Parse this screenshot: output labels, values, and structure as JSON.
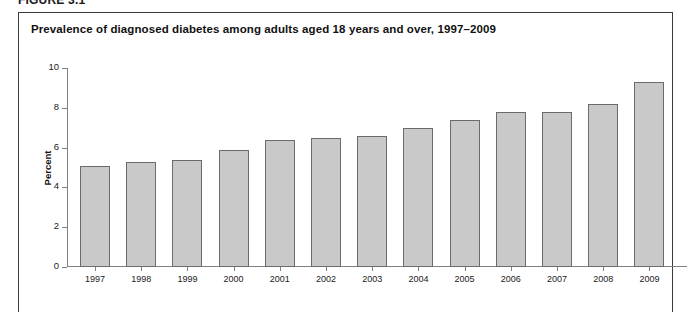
{
  "figure": {
    "label": "FIGURE 3.1",
    "title": "Prevalence of diagnosed diabetes among adults aged 18 years and over, 1997–2009"
  },
  "chart_data": {
    "type": "bar",
    "title": "Prevalence of diagnosed diabetes among adults aged 18 years and over, 1997–2009",
    "xlabel": "",
    "ylabel": "Percent",
    "ylim": [
      0,
      10
    ],
    "yticks": [
      0,
      2,
      4,
      6,
      8,
      10
    ],
    "ytick_labels": [
      "0",
      "2",
      "4",
      "6",
      "8",
      "10"
    ],
    "grid": false,
    "legend": null,
    "bar_color": "#c9c9c9",
    "bar_edge_color": "#6b6b6b",
    "axis_color": "#808080",
    "categories": [
      "1997",
      "1998",
      "1999",
      "2000",
      "2001",
      "2002",
      "2003",
      "2004",
      "2005",
      "2006",
      "2007",
      "2008",
      "2009"
    ],
    "values": [
      5.1,
      5.3,
      5.4,
      5.9,
      6.4,
      6.5,
      6.6,
      7.0,
      7.4,
      7.8,
      7.8,
      8.2,
      9.3
    ]
  }
}
